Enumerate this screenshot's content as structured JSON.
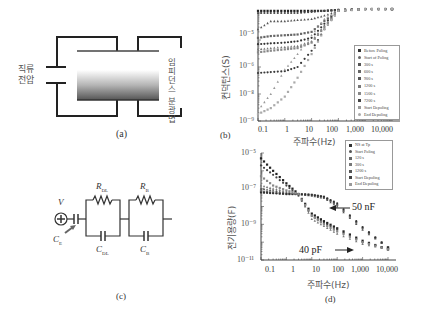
{
  "panels": {
    "a": {
      "caption": "(a)",
      "left_label_line1": "직류",
      "left_label_line2": "전압",
      "right_label": "임피던스 분광법"
    },
    "b": {
      "caption": "(b)",
      "ylabel": "컨덕턴스(S)",
      "xlabel": "주파수(Hz)",
      "yticks": [
        "10⁻⁵",
        "10⁻⁶",
        "10⁻⁸",
        "10⁻⁹"
      ],
      "xticks": [
        "0.1",
        "1",
        "10",
        "100",
        "1,000",
        "10,000"
      ],
      "legend": [
        "Before Poling",
        "Start of Poling",
        "300 s",
        "600 s",
        "900 s",
        "1200 s",
        "1500 s",
        "7200 s",
        "Start Depoling",
        "End Depoling"
      ]
    },
    "c": {
      "caption": "(c)",
      "V": "V",
      "CE": "C",
      "CE_sub": "E",
      "RDL": "R",
      "RDL_sub": "DL",
      "RB": "R",
      "RB_sub": "B",
      "CDL": "C",
      "CDL_sub": "DL",
      "CB": "C",
      "CB_sub": "B"
    },
    "d": {
      "caption": "(d)",
      "ylabel": "전기용량(F)",
      "xlabel": "주파수(Hz)",
      "yticks": [
        "10⁻⁵",
        "10⁻⁷",
        "10⁻⁹",
        "10⁻¹¹"
      ],
      "xticks": [
        "0.1",
        "1",
        "10",
        "100",
        "1,000",
        "10,000"
      ],
      "legend": [
        "NS at Tp",
        "Start Poling",
        "120 s",
        "300 s",
        "1200 s",
        "Start Depoling",
        "End Depoling"
      ],
      "annotation_high": "50 nF",
      "annotation_low": "40 pF"
    }
  },
  "chart_data": [
    {
      "id": "b",
      "type": "scatter",
      "title": "",
      "xlabel": "주파수(Hz)",
      "ylabel": "컨덕턴스(S)",
      "xscale": "log",
      "yscale": "log",
      "xlim": [
        0.1,
        10000
      ],
      "ylim": [
        1e-09,
        1e-05
      ],
      "x": [
        0.1,
        0.3,
        1,
        3,
        10,
        30,
        100,
        1000,
        10000
      ],
      "series": [
        {
          "name": "Before Poling",
          "values": [
            1.2e-05,
            1.2e-05,
            1.2e-05,
            1.2e-05,
            1.2e-05,
            1.2e-05,
            1.3e-05,
            1.4e-05,
            1.4e-05
          ]
        },
        {
          "name": "Start of Poling",
          "values": [
            1e-05,
            1e-05,
            1e-05,
            1e-05,
            1.1e-05,
            1.2e-05,
            1.3e-05,
            1.4e-05,
            1.4e-05
          ]
        },
        {
          "name": "300 s",
          "values": [
            2.5e-06,
            5e-06,
            5e-06,
            5.5e-06,
            6e-06,
            8e-06,
            1.2e-05,
            1.4e-05,
            1.4e-05
          ]
        },
        {
          "name": "600 s",
          "values": [
            1.2e-06,
            1.4e-06,
            1.5e-06,
            1.6e-06,
            2e-06,
            5e-06,
            1.2e-05,
            1.4e-05,
            1.4e-05
          ]
        },
        {
          "name": "900 s",
          "values": [
            7e-07,
            7.5e-07,
            8e-07,
            9e-07,
            1.2e-06,
            4e-06,
            1.2e-05,
            1.4e-05,
            1.4e-05
          ]
        },
        {
          "name": "1200 s",
          "values": [
            4.5e-07,
            5e-07,
            5.5e-07,
            6e-07,
            9e-07,
            3.5e-06,
            1.2e-05,
            1.4e-05,
            1.4e-05
          ]
        },
        {
          "name": "1500 s",
          "values": [
            3.5e-07,
            4e-07,
            4.5e-07,
            5e-07,
            8e-07,
            3e-06,
            1.2e-05,
            1.4e-05,
            1.4e-05
          ]
        },
        {
          "name": "7200 s",
          "values": [
            6e-08,
            6.5e-08,
            7e-08,
            1e-07,
            4e-07,
            2.5e-06,
            1.2e-05,
            1.4e-05,
            1.4e-05
          ]
        },
        {
          "name": "Start Depoling",
          "values": [
            2.5e-09,
            1e-08,
            8e-08,
            3e-07,
            1.5e-06,
            6e-06,
            1.2e-05,
            1.4e-05,
            1.4e-05
          ]
        },
        {
          "name": "End Depoling",
          "values": [
            1.8e-09,
            3e-09,
            8e-09,
            4e-08,
            3e-07,
            2.5e-06,
            1.2e-05,
            1.4e-05,
            1.4e-05
          ]
        }
      ],
      "legend_position": "right"
    },
    {
      "id": "d",
      "type": "scatter",
      "title": "",
      "xlabel": "주파수(Hz)",
      "ylabel": "전기용량(F)",
      "xscale": "log",
      "yscale": "log",
      "xlim": [
        0.1,
        10000
      ],
      "ylim": [
        1e-11,
        1e-05
      ],
      "x": [
        0.1,
        0.3,
        1,
        3,
        10,
        30,
        100,
        1000,
        10000
      ],
      "series": [
        {
          "name": "NS at Tp",
          "values": [
            5e-06,
            1e-06,
            2e-07,
            5e-08,
            4e-09,
            1.5e-09,
            6e-10,
            1.2e-10,
            4e-11
          ]
        },
        {
          "name": "Start Poling",
          "values": [
            2e-06,
            6e-07,
            1.5e-07,
            4e-08,
            3e-09,
            1.2e-09,
            5e-10,
            1e-10,
            4e-11
          ]
        },
        {
          "name": "120 s",
          "values": [
            1e-07,
            8e-08,
            6e-08,
            5e-08,
            4e-08,
            3e-08,
            1e-08,
            5e-10,
            5e-11
          ]
        },
        {
          "name": "300 s",
          "values": [
            7e-08,
            6e-08,
            5e-08,
            5e-08,
            4.5e-08,
            3.5e-08,
            1.2e-08,
            6e-10,
            5e-11
          ]
        },
        {
          "name": "1200 s",
          "values": [
            6e-08,
            5.5e-08,
            5e-08,
            5e-08,
            4.5e-08,
            3.5e-08,
            1.5e-08,
            7e-10,
            5e-11
          ]
        },
        {
          "name": "Start Depoling",
          "values": [
            1.5e-07,
            1e-07,
            7e-08,
            5e-08,
            2e-09,
            8e-10,
            3e-10,
            8e-11,
            4e-11
          ]
        },
        {
          "name": "End Depoling",
          "values": [
            5e-07,
            1.5e-07,
            8e-08,
            5e-08,
            3e-09,
            1e-09,
            4e-10,
            1e-10,
            4e-11
          ]
        }
      ],
      "annotations": [
        {
          "text": "50 nF",
          "arrow_to": [
            60,
            5e-08
          ]
        },
        {
          "text": "40 pF",
          "arrow_to": [
            10000,
            4e-11
          ]
        }
      ],
      "legend_position": "top-right"
    }
  ]
}
